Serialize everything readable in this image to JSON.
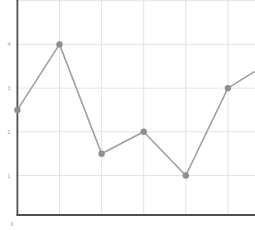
{
  "page": {
    "background": "#ffffff"
  },
  "chart_data": {
    "type": "line",
    "x": [
      0,
      1,
      2,
      3,
      4,
      5
    ],
    "values": [
      2.5,
      4,
      1.5,
      2,
      1,
      3
    ],
    "clipped_continuation": {
      "x": 5.64,
      "y": 3.38
    },
    "xlim": [
      0,
      5.64
    ],
    "ylim": [
      0,
      5
    ],
    "y_ticks": [
      1,
      2,
      3,
      4
    ],
    "y_tick_labels": [
      "1",
      "2",
      "3",
      "4"
    ],
    "origin_label": "0",
    "x_gridlines": [
      1,
      2,
      3,
      4,
      5
    ],
    "y_gridlines": [
      1,
      2,
      3,
      4,
      5
    ],
    "grid": true,
    "legend": "none",
    "marker": "circle",
    "colors": {
      "line": "#a0a0a0",
      "point": "#8e8e8e",
      "grid": "#e3e3e7",
      "axis": "#4f4f4f",
      "tick_label": "#9a9a9a",
      "background": "#ffffff"
    }
  }
}
